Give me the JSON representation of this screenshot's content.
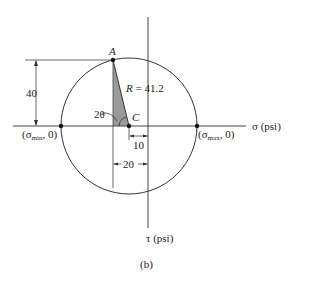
{
  "diagram": {
    "type": "mohr-circle",
    "caption": "(b)",
    "axes": {
      "sigma_label": "σ (psi)",
      "tau_label": "τ (psi)"
    },
    "points": {
      "A": "A",
      "C": "C",
      "sigma_min": {
        "prefix": "(σ",
        "sub": "min",
        "suffix": ", 0)"
      },
      "sigma_max": {
        "prefix": "(σ",
        "sub": "max",
        "suffix": ", 0)"
      }
    },
    "annotations": {
      "radius": "R = 41.2",
      "angle": "2θ",
      "height": "40",
      "offset_center": "10",
      "offset_A": "20"
    },
    "values": {
      "R": 41.2,
      "tau_A": 40,
      "center_offset": 10,
      "A_offset": 20
    },
    "colors": {
      "line": "#333333",
      "shade": "#9a9a9a"
    }
  }
}
